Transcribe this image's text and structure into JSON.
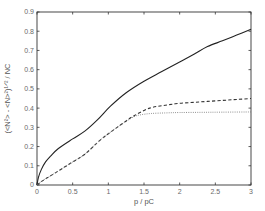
{
  "chart_data": {
    "type": "line",
    "title": "",
    "xlabel": "p / p_C",
    "ylabel": "(<N²> - <N>²)^(1/2) / N_C",
    "xlim": [
      0,
      3
    ],
    "ylim": [
      0,
      0.9
    ],
    "grid": false,
    "legend": null,
    "x_ticks": [
      "0",
      "0.5",
      "1",
      "1.5",
      "2",
      "2.5",
      "3"
    ],
    "y_ticks": [
      "0",
      "0.1",
      "0.2",
      "0.3",
      "0.4",
      "0.5",
      "0.6",
      "0.7",
      "0.8",
      "0.9"
    ],
    "series": [
      {
        "name": "solid",
        "style": "solid",
        "x": [
          0,
          0.02,
          0.06,
          0.12,
          0.19,
          0.3,
          0.5,
          0.67,
          0.85,
          1.03,
          1.25,
          1.5,
          1.75,
          2.0,
          2.2,
          2.39,
          2.6,
          2.8,
          3.0
        ],
        "y": [
          0,
          0.04,
          0.08,
          0.12,
          0.15,
          0.19,
          0.24,
          0.28,
          0.34,
          0.41,
          0.48,
          0.54,
          0.59,
          0.64,
          0.68,
          0.72,
          0.75,
          0.78,
          0.81
        ]
      },
      {
        "name": "dashed",
        "style": "dashed",
        "x": [
          0,
          0.05,
          0.11,
          0.2,
          0.35,
          0.5,
          0.67,
          0.89,
          1.05,
          1.2,
          1.36,
          1.58,
          1.8,
          2.0,
          2.2,
          2.39,
          2.6,
          2.8,
          3.0
        ],
        "y": [
          0,
          0.015,
          0.03,
          0.05,
          0.085,
          0.12,
          0.16,
          0.235,
          0.28,
          0.32,
          0.36,
          0.4,
          0.415,
          0.425,
          0.43,
          0.435,
          0.44,
          0.445,
          0.45
        ]
      },
      {
        "name": "dotted",
        "style": "dotted",
        "x": [
          0,
          0.05,
          0.11,
          0.2,
          0.35,
          0.5,
          0.67,
          0.89,
          1.05,
          1.2,
          1.36,
          1.45,
          1.6,
          1.8,
          2.0,
          2.3,
          2.6,
          3.0
        ],
        "y": [
          0,
          0.015,
          0.03,
          0.05,
          0.085,
          0.12,
          0.16,
          0.235,
          0.28,
          0.32,
          0.355,
          0.365,
          0.372,
          0.375,
          0.377,
          0.378,
          0.379,
          0.38
        ]
      }
    ]
  },
  "layout": {
    "plot_left": 37,
    "plot_right": 251,
    "plot_top": 12,
    "plot_bottom": 185
  }
}
